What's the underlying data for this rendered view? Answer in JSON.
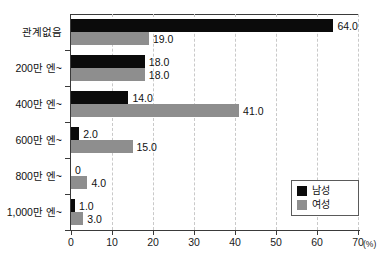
{
  "chart_data": {
    "type": "bar",
    "orientation": "horizontal",
    "title": "",
    "xlabel": "(%)",
    "ylabel": "",
    "xlim": [
      0,
      70
    ],
    "xticks": [
      "0",
      "10",
      "20",
      "30",
      "40",
      "50",
      "60",
      "70"
    ],
    "xtick_values": [
      0,
      10,
      20,
      30,
      40,
      50,
      60,
      70
    ],
    "grid": true,
    "grid_axis": "x",
    "legend_position": "bottom-right",
    "categories": [
      "관계없음",
      "200만 엔~",
      "400만 엔~",
      "600만 엔~",
      "800만 엔~",
      "1,000만 엔~"
    ],
    "series": [
      {
        "name": "남성",
        "color": "#0b0b0b",
        "values": [
          64.0,
          18.0,
          14.0,
          2.0,
          0,
          1.0
        ],
        "labels": [
          "64.0",
          "18.0",
          "14.0",
          "2.0",
          "0",
          "1.0"
        ]
      },
      {
        "name": "여성",
        "color": "#8e8e8e",
        "values": [
          19.0,
          18.0,
          41.0,
          15.0,
          4.0,
          3.0
        ],
        "labels": [
          "19.0",
          "18.0",
          "41.0",
          "15.0",
          "4.0",
          "3.0"
        ]
      }
    ]
  },
  "axis": {
    "unit": "(%)"
  },
  "legend": {
    "items": [
      {
        "label": "남성",
        "color": "#0b0b0b"
      },
      {
        "label": "여성",
        "color": "#8e8e8e"
      }
    ]
  }
}
